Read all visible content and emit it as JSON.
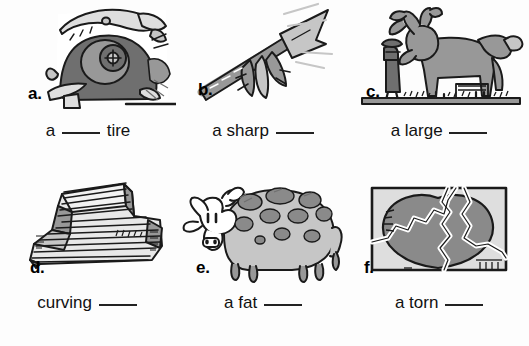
{
  "worksheet": {
    "background_color": "#fdfdfd",
    "ink_color": "#111111",
    "blank_char": "____",
    "items": [
      {
        "marker": "a.",
        "icon": "flat-tire-icon",
        "caption_before": "a",
        "caption_after": "tire",
        "alt": "close-up of a car wheel with a flat tire"
      },
      {
        "marker": "b.",
        "icon": "arrow-icon",
        "caption_before": "a sharp",
        "caption_after": "",
        "alt": "a feathered arrow pointing up and to the right"
      },
      {
        "marker": "c.",
        "icon": "moose-icon",
        "caption_before": "a large",
        "caption_after": "",
        "alt": "a large moose standing next to a small person and a fence"
      },
      {
        "marker": "d.",
        "icon": "stairs-icon",
        "caption_before": "curving",
        "caption_after": "",
        "alt": "a curving flight of stairs"
      },
      {
        "marker": "e.",
        "icon": "cow-icon",
        "caption_before": "a fat",
        "caption_after": "",
        "alt": "a fat spotted cow"
      },
      {
        "marker": "f.",
        "icon": "torn-picture-icon",
        "caption_before": "a torn",
        "caption_after": "",
        "alt": "a torn picture of a heart"
      }
    ]
  },
  "palette": {
    "outline": "#1a1a1a",
    "dark_gray": "#6f6f6f",
    "mid_gray": "#989898",
    "light_gray": "#c6c6c6",
    "pale_gray": "#dedede",
    "white": "#ffffff"
  }
}
